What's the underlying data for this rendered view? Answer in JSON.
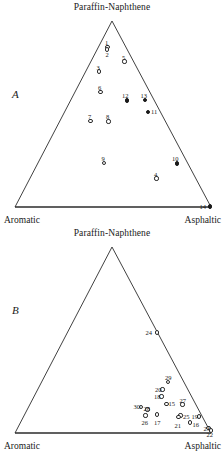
{
  "figure": {
    "type": "ternary-scatter-pair",
    "axis_apex": "Paraffin-Naphthene",
    "axis_left": "Aromatic",
    "axis_right": "Asphaltic"
  },
  "panels": [
    {
      "letter": "A",
      "apex_label": "Paraffin-Naphthene",
      "left_label": "Aromatic",
      "right_label": "Asphaltic",
      "points": [
        {
          "label": "1",
          "x": 107.5,
          "y": 47.0,
          "style": "open",
          "lx": 105.0,
          "ly": 39.5
        },
        {
          "label": "2",
          "x": 107.0,
          "y": 49.5,
          "style": "open",
          "lx": 105.5,
          "ly": 52.0
        },
        {
          "label": "3",
          "x": 99.0,
          "y": 71.5,
          "style": "open",
          "lx": 96.5,
          "ly": 64.5
        },
        {
          "label": "5",
          "x": 124.5,
          "y": 61.5,
          "style": "open",
          "lx": 122.0,
          "ly": 54.5
        },
        {
          "label": "6",
          "x": 100.5,
          "y": 92.0,
          "style": "open",
          "lx": 98.0,
          "ly": 85.0
        },
        {
          "label": "12",
          "x": 127.0,
          "y": 100.5,
          "style": "filled",
          "lx": 122.0,
          "ly": 93.0
        },
        {
          "label": "13",
          "x": 145.0,
          "y": 100.0,
          "style": "filled",
          "lx": 140.5,
          "ly": 92.5
        },
        {
          "label": "11",
          "x": 148.0,
          "y": 112.0,
          "style": "filled",
          "lx": 151.0,
          "ly": 109.0
        },
        {
          "label": "7",
          "x": 90.5,
          "y": 121.0,
          "style": "open",
          "lx": 88.0,
          "ly": 114.0
        },
        {
          "label": "8",
          "x": 108.5,
          "y": 121.5,
          "style": "open",
          "lx": 106.0,
          "ly": 114.0
        },
        {
          "label": "9",
          "x": 104.0,
          "y": 163.0,
          "style": "open",
          "lx": 101.5,
          "ly": 155.5
        },
        {
          "label": "10",
          "x": 177.0,
          "y": 163.5,
          "style": "filled",
          "lx": 172.0,
          "ly": 156.0
        },
        {
          "label": "4",
          "x": 156.5,
          "y": 178.5,
          "style": "open",
          "lx": 154.0,
          "ly": 171.5
        },
        {
          "label": "14",
          "x": 210.0,
          "y": 206.5,
          "style": "filled",
          "lx": 199.5,
          "ly": 203.5
        }
      ]
    },
    {
      "letter": "B",
      "apex_label": "Paraffin-Naphthene",
      "left_label": "Aromatic",
      "right_label": "Asphaltic",
      "points": [
        {
          "label": "24",
          "x": 157.0,
          "y": 106.5,
          "style": "open",
          "lx": 145.5,
          "ly": 103.5
        },
        {
          "label": "29",
          "x": 168.0,
          "y": 156.0,
          "style": "open",
          "lx": 165.0,
          "ly": 149.0
        },
        {
          "label": "20",
          "x": 162.5,
          "y": 163.5,
          "style": "open",
          "lx": 155.0,
          "ly": 160.5
        },
        {
          "label": "18",
          "x": 161.5,
          "y": 170.5,
          "style": "open",
          "lx": 154.0,
          "ly": 167.5
        },
        {
          "label": "15",
          "x": 166.5,
          "y": 178.0,
          "style": "open",
          "lx": 168.5,
          "ly": 175.0
        },
        {
          "label": "27",
          "x": 182.5,
          "y": 178.5,
          "style": "open",
          "lx": 179.5,
          "ly": 171.5
        },
        {
          "label": "30",
          "x": 141.0,
          "y": 181.0,
          "style": "open",
          "lx": 133.5,
          "ly": 177.5
        },
        {
          "label": "28",
          "x": 147.5,
          "y": 183.5,
          "style": "open",
          "lx": 143.5,
          "ly": 180.0
        },
        {
          "label": "26",
          "x": 145.5,
          "y": 189.5,
          "style": "open",
          "lx": 141.5,
          "ly": 193.5
        },
        {
          "label": "17",
          "x": 157.0,
          "y": 188.5,
          "style": "open",
          "lx": 154.0,
          "ly": 194.0
        },
        {
          "label": "25",
          "x": 180.5,
          "y": 189.5,
          "style": "open",
          "lx": 183.0,
          "ly": 187.5
        },
        {
          "label": "21",
          "x": 178.5,
          "y": 191.0,
          "style": "open",
          "lx": 174.5,
          "ly": 196.5
        },
        {
          "label": "19",
          "x": 199.0,
          "y": 190.5,
          "style": "open",
          "lx": 191.5,
          "ly": 188.0
        },
        {
          "label": "16",
          "x": 190.0,
          "y": 196.5,
          "style": "open",
          "lx": 192.5,
          "ly": 195.5
        },
        {
          "label": "23",
          "x": 208.5,
          "y": 202.0,
          "style": "open",
          "lx": 203.5,
          "ly": 200.0
        },
        {
          "label": "22",
          "x": 211.0,
          "y": 204.5,
          "style": "open",
          "lx": 206.5,
          "ly": 205.5
        }
      ]
    }
  ],
  "chart_data": {
    "type": "scatter",
    "axes": {
      "apex": "Paraffin-Naphthene",
      "bottom_left": "Aromatic",
      "bottom_right": "Asphaltic"
    },
    "grid": false,
    "legend": "none",
    "series": [
      {
        "name": "A",
        "marker_open_samples": [
          "1",
          "2",
          "3",
          "4",
          "5",
          "6",
          "7",
          "8",
          "9"
        ],
        "marker_filled_samples": [
          "10",
          "11",
          "12",
          "13",
          "14"
        ],
        "labels": [
          "1",
          "2",
          "3",
          "4",
          "5",
          "6",
          "7",
          "8",
          "9",
          "10",
          "11",
          "12",
          "13",
          "14"
        ]
      },
      {
        "name": "B",
        "marker_open_samples": [
          "15",
          "16",
          "17",
          "18",
          "19",
          "20",
          "21",
          "22",
          "23",
          "24",
          "25",
          "26",
          "27",
          "28",
          "29",
          "30"
        ],
        "marker_filled_samples": [],
        "labels": [
          "15",
          "16",
          "17",
          "18",
          "19",
          "20",
          "21",
          "22",
          "23",
          "24",
          "25",
          "26",
          "27",
          "28",
          "29",
          "30"
        ]
      }
    ]
  }
}
